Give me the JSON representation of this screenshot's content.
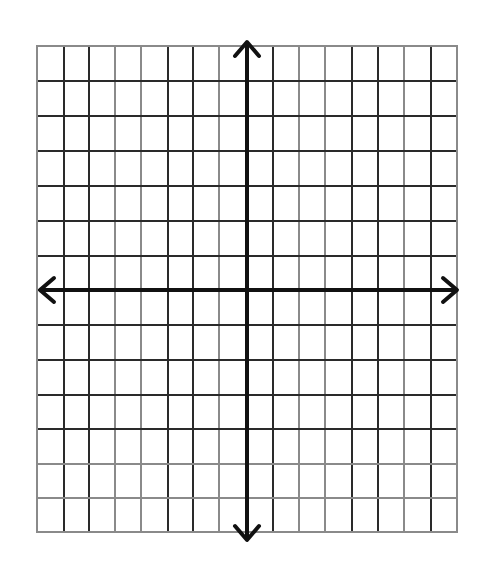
{
  "diagram": {
    "type": "coordinate-plane-grid",
    "grid": {
      "left": 37,
      "top": 46,
      "right": 457,
      "bottom": 532,
      "x_lines": [
        37,
        64,
        89,
        115,
        141,
        168,
        193,
        219,
        246,
        273,
        299,
        325,
        352,
        378,
        404,
        431,
        457
      ],
      "y_lines": [
        46,
        81,
        116,
        151,
        186,
        221,
        256,
        290,
        325,
        360,
        395,
        429,
        464,
        498,
        532
      ],
      "columns": 16,
      "rows": 14,
      "line_color": "#2a2a2a",
      "faint_line_color": "#8a8a8a",
      "faint_x_indices": [
        0,
        3,
        4,
        7,
        10,
        11,
        14
      ],
      "faint_y_indices": [
        12,
        13,
        14
      ]
    },
    "x_axis": {
      "y": 290,
      "x_start": 40,
      "x_end": 457,
      "arrow_left": true,
      "arrow_right": true
    },
    "y_axis": {
      "x": 247,
      "y_start": 42,
      "y_end": 540,
      "arrow_top": true,
      "arrow_bottom": true
    },
    "axis_color": "#111111",
    "labels": []
  }
}
